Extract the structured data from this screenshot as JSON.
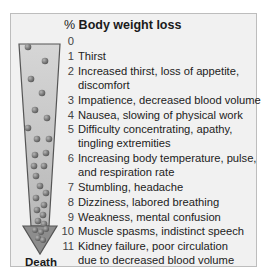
{
  "title": {
    "prefix": "%",
    "label": "Body weight loss"
  },
  "arrow": {
    "end_label": "Death",
    "shaft_color": "#c9c9c9",
    "head_color": "#8a8a8a",
    "outline_color": "#555555",
    "dot_color": "#7a7a7a"
  },
  "stages": [
    {
      "pct": "0",
      "lines": [
        "",
        ""
      ]
    },
    {
      "pct": "1",
      "lines": [
        "Thirst",
        ""
      ]
    },
    {
      "pct": "2",
      "lines": [
        "Increased thirst, loss of appetite,",
        "discomfort"
      ]
    },
    {
      "pct": "3",
      "lines": [
        "Impatience, decreased blood volume",
        ""
      ]
    },
    {
      "pct": "4",
      "lines": [
        "Nausea, slowing of physical work",
        ""
      ]
    },
    {
      "pct": "5",
      "lines": [
        "Difficulty concentrating, apathy,",
        "tingling extremities"
      ]
    },
    {
      "pct": "6",
      "lines": [
        "Increasing body temperature, pulse,",
        "and respiration rate"
      ]
    },
    {
      "pct": "7",
      "lines": [
        "Stumbling, headache",
        ""
      ]
    },
    {
      "pct": "8",
      "lines": [
        "Dizziness, labored breathing",
        ""
      ]
    },
    {
      "pct": "9",
      "lines": [
        "Weakness, mental confusion",
        ""
      ]
    },
    {
      "pct": "10",
      "lines": [
        "Muscle spasms, indistinct speech",
        ""
      ]
    },
    {
      "pct": "11",
      "lines": [
        "Kidney failure, poor circulation",
        "due to decreased blood volume"
      ]
    }
  ]
}
